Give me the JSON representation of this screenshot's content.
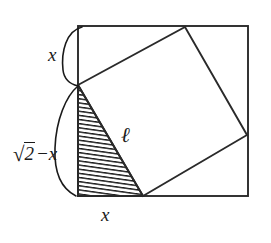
{
  "figure": {
    "type": "geometry-diagram",
    "background_color": "#ffffff",
    "stroke_color": "#1a1a1a",
    "hatch_color": "#1a1a1a",
    "outer_square": {
      "name": "outer-square",
      "corners": {
        "top_left": [
          78,
          26
        ],
        "top_right": [
          248,
          26
        ],
        "bottom_right": [
          248,
          196
        ],
        "bottom_left": [
          78,
          196
        ]
      },
      "side_px": 170
    },
    "inner_square": {
      "name": "inner-tilted-square",
      "vertices": [
        [
          78,
          85
        ],
        [
          185,
          27
        ],
        [
          247,
          135
        ],
        [
          143,
          196
        ]
      ]
    },
    "shaded_triangle": {
      "name": "shaded-triangle",
      "vertices": [
        [
          78,
          85
        ],
        [
          143,
          196
        ],
        [
          78,
          196
        ]
      ],
      "fill": "hatch",
      "hatch_angle_deg": 8,
      "hatch_spacing_px": 4
    },
    "braces": [
      {
        "name": "brace-x-top",
        "from": [
          80,
          27
        ],
        "to": [
          79,
          86
        ],
        "bulge": "left"
      },
      {
        "name": "brace-sqrt2-minus-x",
        "from": [
          79,
          86
        ],
        "to": [
          79,
          196
        ],
        "bulge": "left"
      }
    ],
    "labels": {
      "x_top": "x",
      "x_bottom": "x",
      "sqrt_expression": "√2−x",
      "sqrt_sign": "√",
      "sqrt_radicand": "2",
      "sqrt_tail": "−x",
      "ell": "ℓ"
    }
  }
}
